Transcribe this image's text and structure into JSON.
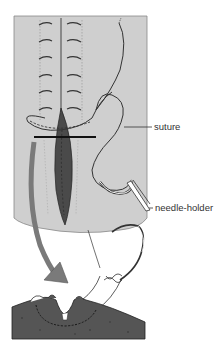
{
  "figure": {
    "labels": {
      "suture": "suture",
      "needle_holder": "needle-holder"
    },
    "colors": {
      "skin": "#cfcfcf",
      "wound": "#4a4a4a",
      "tissue": "#555555",
      "arrow": "#7a7a7a",
      "line": "#2b2b2b",
      "background": "#ffffff"
    }
  }
}
